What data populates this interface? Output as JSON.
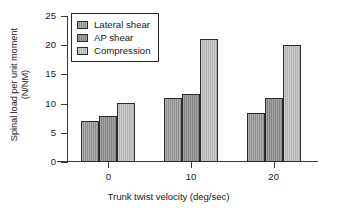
{
  "chart_data": {
    "type": "bar",
    "title": "",
    "subtitle": "",
    "xlabel": "Trunk twist velocity (deg/sec)",
    "ylabel": "Spinal load per unit moment (N/NM)",
    "ylabel_line1": "Spinal load per unit moment",
    "ylabel_line2": "(N/NM)",
    "categories": [
      "0",
      "10",
      "20"
    ],
    "series": [
      {
        "name": "Lateral shear",
        "values": [
          7.0,
          10.9,
          8.4
        ],
        "color": "#8e8e8e"
      },
      {
        "name": "AP shear",
        "values": [
          7.9,
          11.6,
          11.0
        ],
        "color": "#848484"
      },
      {
        "name": "Compression",
        "values": [
          10.1,
          21.0,
          20.0
        ],
        "color": "#b2b2b2"
      }
    ],
    "ylim": [
      0,
      25
    ],
    "ytick_labels": [
      "0",
      "5",
      "10",
      "15",
      "20",
      "25"
    ],
    "ytick_values": [
      0,
      5,
      10,
      15,
      20,
      25
    ],
    "xtick_labels": [
      "0",
      "10",
      "20"
    ],
    "grid": false,
    "legend_position": "upper left inside"
  },
  "legend": {
    "items": [
      {
        "label": "Lateral shear"
      },
      {
        "label": "AP shear"
      },
      {
        "label": "Compression"
      }
    ]
  }
}
